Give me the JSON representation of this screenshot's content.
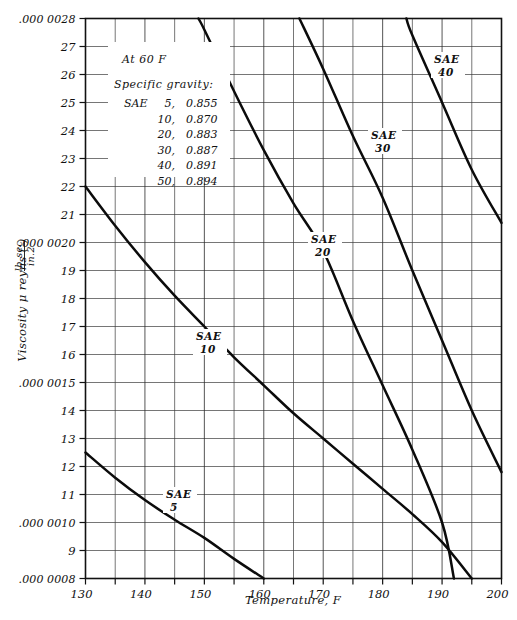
{
  "chart_data": {
    "type": "line",
    "title": "",
    "xlabel": "Temperature, F",
    "ylabel": "Viscosity μ reyns (lb sec / in.²)",
    "xlim": [
      130,
      200
    ],
    "ylim": [
      8,
      28
    ],
    "y_scale_note": "values in units of 1e-7 reyns",
    "grid": true,
    "legend": "inline curve labels",
    "xticks": [
      130,
      140,
      150,
      160,
      170,
      180,
      190,
      200
    ],
    "xtick_labels": [
      "130",
      "140",
      "150",
      "160",
      "170",
      "180",
      "190",
      "200"
    ],
    "x_minor_step": 5,
    "yticks": [
      8,
      9,
      10,
      11,
      12,
      13,
      14,
      15,
      16,
      17,
      18,
      19,
      20,
      21,
      22,
      23,
      24,
      25,
      26,
      27,
      28
    ],
    "ytick_labels": [
      ".000 0008",
      "9",
      ".000 0010",
      "11",
      "12",
      "13",
      ".000 0015",
      "14",
      "16",
      "17",
      "18",
      "19",
      ".000 0020",
      "21",
      "22",
      "23",
      "24",
      "25",
      "26",
      "27",
      ".000 0028"
    ],
    "ytick_label_map": {
      "8": ".000 0008",
      "9": "9",
      "10": ".000 0010",
      "11": "11",
      "12": "12",
      "13": "13",
      "14": "14",
      "15": ".000 0015",
      "16": "16",
      "17": "17",
      "18": "18",
      "19": "19",
      "20": ".000 0020",
      "21": "21",
      "22": "22",
      "23": "23",
      "24": "24",
      "25": "25",
      "26": "26",
      "27": "27",
      "28": ".000 0028"
    },
    "series": [
      {
        "name": "SAE 5",
        "label": "SAE",
        "label_sub": "5",
        "x": [
          130,
          135,
          140,
          145,
          150,
          155,
          160
        ],
        "values": [
          12.5,
          11.6,
          10.8,
          10.1,
          9.45,
          8.7,
          8.0
        ]
      },
      {
        "name": "SAE 10",
        "label": "SAE",
        "label_sub": "10",
        "x": [
          130,
          135,
          140,
          145,
          150,
          155,
          160,
          165,
          170,
          175,
          180,
          185,
          190,
          195
        ],
        "values": [
          22.0,
          20.6,
          19.3,
          18.1,
          17.0,
          15.9,
          14.9,
          13.9,
          13.0,
          12.1,
          11.2,
          10.3,
          9.3,
          8.0
        ]
      },
      {
        "name": "SAE 20",
        "label": "SAE",
        "label_sub": "20",
        "x": [
          149,
          150,
          155,
          160,
          165,
          170,
          175,
          180,
          185,
          190,
          192
        ],
        "values": [
          28.0,
          27.6,
          25.4,
          23.3,
          21.4,
          19.7,
          17.2,
          14.9,
          12.6,
          10.0,
          8.0
        ]
      },
      {
        "name": "SAE 30",
        "label": "SAE",
        "label_sub": "30",
        "x": [
          166,
          170,
          175,
          180,
          185,
          190,
          195,
          200
        ],
        "values": [
          28.0,
          26.2,
          23.8,
          21.6,
          19.0,
          16.5,
          14.0,
          11.8
        ]
      },
      {
        "name": "SAE 40",
        "label": "SAE",
        "label_sub": "40",
        "x": [
          184,
          185,
          190,
          195,
          200
        ],
        "values": [
          28.0,
          27.4,
          25.0,
          22.6,
          20.7
        ]
      }
    ],
    "annotation": {
      "line1": "At 60 F",
      "line2": "Specific gravity:",
      "rows": [
        {
          "label": "SAE",
          "sae": "5,",
          "value": "0.855"
        },
        {
          "label": "",
          "sae": "10,",
          "value": "0.870"
        },
        {
          "label": "",
          "sae": "20,",
          "value": "0.883"
        },
        {
          "label": "",
          "sae": "30,",
          "value": "0.887"
        },
        {
          "label": "",
          "sae": "40,",
          "value": "0.891"
        },
        {
          "label": "",
          "sae": "50,",
          "value": "0.894"
        }
      ]
    },
    "colors": {
      "curve": "#0b0b0b",
      "grid": "#3b3b3b",
      "frame": "#111111",
      "background": "#ffffff"
    }
  },
  "ylabel_parts": {
    "main": "Viscosity μ reyns (",
    "num": "lb sec",
    "den": "in.",
    "exp": "2",
    "close": ")"
  }
}
